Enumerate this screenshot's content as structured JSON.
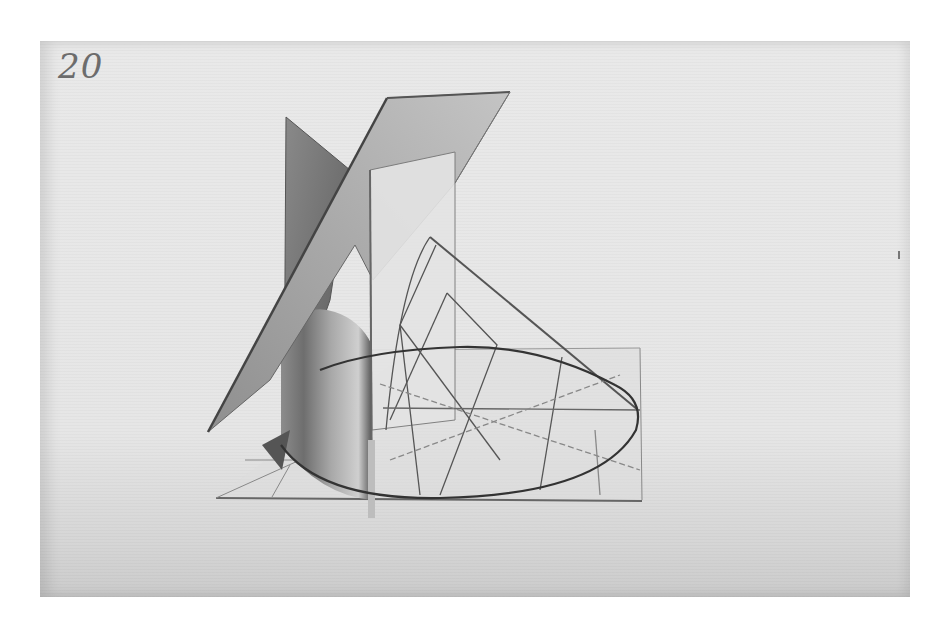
{
  "artwork": {
    "plate_number": "20",
    "subject": "Geometric study: intersecting planes, cylinder and cone on a ground plane",
    "medium_appearance": "pencil and grey wash on paper",
    "colors": {
      "background": "#ffffff",
      "paper": "#e8e8e8",
      "wash_dark": "#5a5a5a",
      "wash_mid": "#9a9a9a",
      "line": "#555555"
    }
  }
}
